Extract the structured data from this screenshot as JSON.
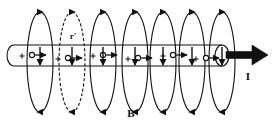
{
  "figure": {
    "background_color": "#fefefe",
    "stroke_color": "#111111",
    "width": 274,
    "height": 127
  },
  "labels": {
    "field_label": "B",
    "current_label": "I",
    "radius_label": "r'"
  },
  "conductor": {
    "name": "cylindrical-conductor",
    "left_x": 14,
    "right_x": 222,
    "top_y": 45,
    "bottom_y": 66,
    "cap_rx": 7,
    "current_arrow": {
      "name": "current-arrow",
      "start_x": 226,
      "tip_x": 268,
      "y": 55,
      "color": "#111111"
    },
    "internal_markers": [
      {
        "plus_x": 22,
        "circle_x": 32,
        "arrow_tip_x": 46,
        "y": 56
      },
      {
        "plus_x": 58,
        "circle_x": 68,
        "arrow_tip_x": 82,
        "y": 59
      },
      {
        "plus_x": 93,
        "circle_x": 103,
        "arrow_tip_x": 117,
        "y": 56
      },
      {
        "plus_x": 128,
        "circle_x": 138,
        "arrow_tip_x": 152,
        "y": 59
      },
      {
        "plus_x": 163,
        "circle_x": 173,
        "arrow_tip_x": 187,
        "y": 56
      },
      {
        "plus_x": 196,
        "circle_x": 206,
        "arrow_tip_x": 219,
        "y": 59
      }
    ]
  },
  "field_loops": {
    "name": "magnetic-field-loops",
    "count": 7,
    "top_y": 12,
    "bottom_y": 112,
    "rx": 13,
    "loops": [
      {
        "cx": 40,
        "style": "solid",
        "dashed": false
      },
      {
        "cx": 72,
        "style": "dashed",
        "dashed": true
      },
      {
        "cx": 103,
        "style": "solid",
        "dashed": false
      },
      {
        "cx": 135,
        "style": "solid",
        "dashed": false
      },
      {
        "cx": 163,
        "style": "solid",
        "dashed": false
      },
      {
        "cx": 192,
        "style": "solid",
        "dashed": false
      },
      {
        "cx": 222,
        "style": "solid",
        "dashed": false
      }
    ]
  },
  "label_positions": {
    "field_label": {
      "x": 131,
      "y": 117
    },
    "current_label": {
      "x": 248,
      "y": 80
    },
    "radius_label": {
      "x": 73,
      "y": 39
    }
  }
}
